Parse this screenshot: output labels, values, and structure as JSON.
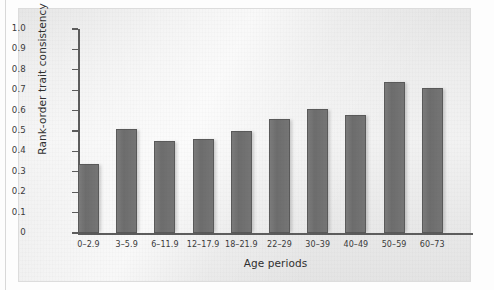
{
  "figure": {
    "background_color": "#fdfdfd",
    "panel_color": "#ebebeb",
    "bar_color": "#6d6d6d",
    "axis_color": "#5d5d5d"
  },
  "chart_data": {
    "type": "bar",
    "title": "",
    "xlabel": "Age periods",
    "ylabel": "Rank-order trait consistency",
    "categories": [
      "0–2.9",
      "3–5.9",
      "6–11.9",
      "12–17.9",
      "18–21.9",
      "22–29",
      "30–39",
      "40–49",
      "50–59",
      "60–73"
    ],
    "values": [
      0.34,
      0.51,
      0.45,
      0.46,
      0.5,
      0.56,
      0.61,
      0.58,
      0.74,
      0.71
    ],
    "ylim": [
      0,
      1.0
    ],
    "yticks": [
      0,
      0.1,
      0.2,
      0.3,
      0.4,
      0.5,
      0.6,
      0.7,
      0.8,
      0.9,
      1.0
    ],
    "ytick_labels": [
      "0",
      "0.1",
      "0.2",
      "0.3",
      "0.4",
      "0.5",
      "0.6",
      "0.7",
      "0.8",
      "0.9",
      "1.0"
    ],
    "grid": false,
    "legend": null
  }
}
